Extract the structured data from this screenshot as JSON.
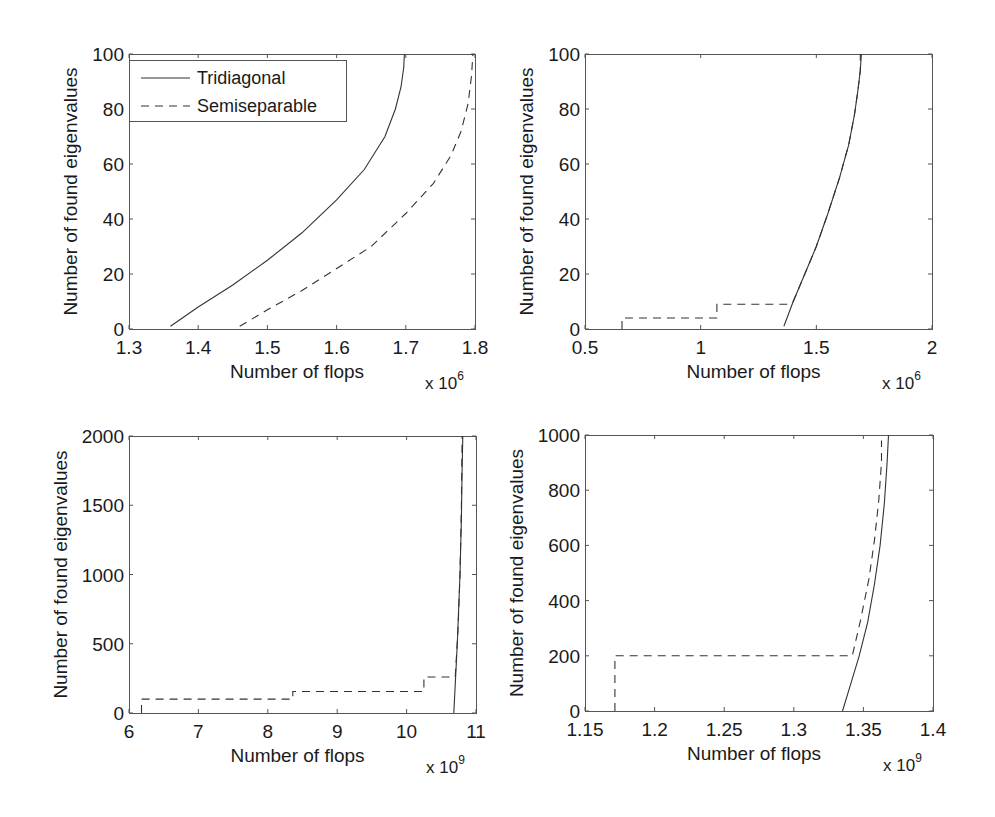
{
  "figure": {
    "legend": {
      "entries": [
        {
          "label": "Tridiagonal",
          "style": "solid"
        },
        {
          "label": "Semiseparable",
          "style": "dashed"
        }
      ]
    }
  },
  "chart_data": [
    {
      "type": "line",
      "position": "top-left",
      "xlabel": "Number of flops",
      "ylabel": "Number of found eigenvalues",
      "x_multiplier": "x 10",
      "x_exponent": "6",
      "xlim": [
        1.3,
        1.8
      ],
      "ylim": [
        0,
        100
      ],
      "xticks": [
        "1.3",
        "1.4",
        "1.5",
        "1.6",
        "1.7",
        "1.8"
      ],
      "yticks": [
        "0",
        "20",
        "40",
        "60",
        "80",
        "100"
      ],
      "legend": {
        "position": "upper-left",
        "entries": [
          "Tridiagonal",
          "Semiseparable"
        ]
      },
      "series": [
        {
          "name": "Tridiagonal",
          "style": "solid",
          "x": [
            1.36,
            1.4,
            1.45,
            1.5,
            1.55,
            1.6,
            1.64,
            1.67,
            1.685,
            1.693,
            1.697,
            1.698
          ],
          "y": [
            1,
            8,
            16,
            25,
            35,
            47,
            58,
            70,
            80,
            88,
            95,
            100
          ]
        },
        {
          "name": "Semiseparable",
          "style": "dashed",
          "x": [
            1.46,
            1.5,
            1.55,
            1.6,
            1.65,
            1.7,
            1.74,
            1.765,
            1.78,
            1.79,
            1.795,
            1.797
          ],
          "y": [
            1,
            7,
            14,
            22,
            30,
            42,
            53,
            63,
            72,
            82,
            92,
            100
          ]
        }
      ]
    },
    {
      "type": "line",
      "position": "top-right",
      "xlabel": "Number of flops",
      "ylabel": "Number of found eigenvalues",
      "x_multiplier": "x 10",
      "x_exponent": "6",
      "xlim": [
        0.5,
        2.0
      ],
      "ylim": [
        0,
        100
      ],
      "xticks": [
        "0.5",
        "1",
        "1.5",
        "2"
      ],
      "yticks": [
        "0",
        "20",
        "40",
        "60",
        "80",
        "100"
      ],
      "series": [
        {
          "name": "Tridiagonal",
          "style": "solid",
          "x": [
            1.36,
            1.4,
            1.45,
            1.5,
            1.55,
            1.6,
            1.64,
            1.665,
            1.68,
            1.69,
            1.695
          ],
          "y": [
            1,
            10,
            20,
            30,
            42,
            55,
            67,
            78,
            87,
            94,
            100
          ]
        },
        {
          "name": "Semiseparable",
          "style": "dashed",
          "x": [
            0.66,
            0.66,
            1.07,
            1.07,
            1.38,
            1.4,
            1.45,
            1.5,
            1.55,
            1.6,
            1.64,
            1.665,
            1.68,
            1.69,
            1.69
          ],
          "y": [
            0,
            4,
            4,
            9,
            9,
            10,
            20,
            30,
            42,
            55,
            67,
            78,
            87,
            94,
            100
          ]
        }
      ]
    },
    {
      "type": "line",
      "position": "bottom-left",
      "xlabel": "Number of flops",
      "ylabel": "Number of found eigenvalues",
      "x_multiplier": "x 10",
      "x_exponent": "9",
      "xlim": [
        6,
        11
      ],
      "ylim": [
        0,
        2000
      ],
      "xticks": [
        "6",
        "7",
        "8",
        "9",
        "10",
        "11"
      ],
      "yticks": [
        "0",
        "500",
        "1000",
        "1500",
        "2000"
      ],
      "series": [
        {
          "name": "Tridiagonal",
          "style": "solid",
          "x": [
            10.68,
            10.73,
            10.77,
            10.79,
            10.8,
            10.81
          ],
          "y": [
            0,
            500,
            1000,
            1400,
            1750,
            2000
          ]
        },
        {
          "name": "Semiseparable",
          "style": "dashed",
          "x": [
            6.18,
            6.18,
            8.36,
            8.36,
            10.25,
            10.25,
            10.7,
            10.74,
            10.77,
            10.79,
            10.8
          ],
          "y": [
            0,
            100,
            100,
            155,
            155,
            260,
            260,
            600,
            1000,
            1500,
            2000
          ]
        }
      ]
    },
    {
      "type": "line",
      "position": "bottom-right",
      "xlabel": "Number of flops",
      "ylabel": "Number of found eigenvalues",
      "x_multiplier": "x 10",
      "x_exponent": "9",
      "xlim": [
        1.15,
        1.4
      ],
      "ylim": [
        0,
        1000
      ],
      "xticks": [
        "1.15",
        "1.2",
        "1.25",
        "1.3",
        "1.35",
        "1.4"
      ],
      "yticks": [
        "0",
        "200",
        "400",
        "600",
        "800",
        "1000"
      ],
      "series": [
        {
          "name": "Tridiagonal",
          "style": "solid",
          "x": [
            1.335,
            1.341,
            1.347,
            1.353,
            1.358,
            1.362,
            1.365,
            1.367,
            1.368
          ],
          "y": [
            0,
            100,
            200,
            320,
            460,
            600,
            750,
            900,
            1000
          ]
        },
        {
          "name": "Semiseparable",
          "style": "dashed",
          "x": [
            1.1715,
            1.1715,
            1.342,
            1.348,
            1.354,
            1.358,
            1.361,
            1.363,
            1.363
          ],
          "y": [
            0,
            200,
            200,
            330,
            480,
            620,
            760,
            900,
            980
          ]
        }
      ]
    }
  ]
}
